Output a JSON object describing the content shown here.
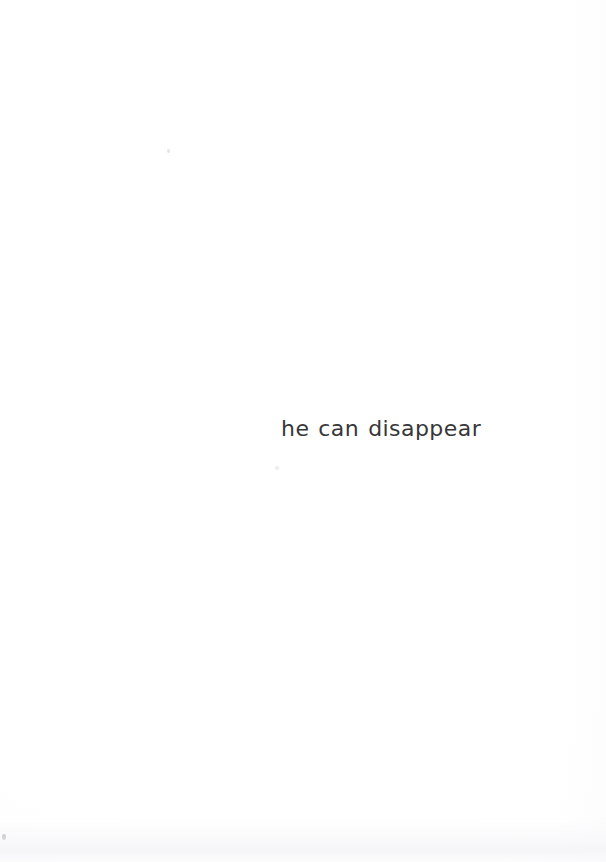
{
  "page": {
    "kind": "scanned-book-page",
    "width": 606,
    "height": 862,
    "background_color": "#ffffff",
    "body_text": "he can disappear",
    "text_color": "#37373a",
    "text_position": {
      "left_px": 281,
      "baseline_px": 438,
      "width_px": 156,
      "alignment": "left-of-block, slightly right of page center"
    },
    "artifacts": {
      "left_edge_speck": "scan speck",
      "upper_speck": "scan speck",
      "mid_speck": "scan speck",
      "bottom_shadow": "page-edge shadow band"
    }
  }
}
